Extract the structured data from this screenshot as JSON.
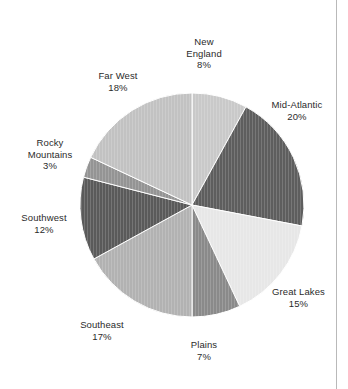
{
  "chart_data": {
    "type": "pie",
    "title": "",
    "subtitle": "",
    "xlabel": "",
    "ylabel": "",
    "legend_position": "none",
    "grid": false,
    "units": "percent",
    "start_angle_deg": 0,
    "direction": "clockwise",
    "categories": [
      "New England",
      "Mid-Atlantic",
      "Great Lakes",
      "Plains",
      "Southeast",
      "Southwest",
      "Rocky Mountains",
      "Far West"
    ],
    "values": [
      8,
      20,
      15,
      7,
      17,
      12,
      3,
      18
    ],
    "value_labels": [
      "8%",
      "20%",
      "15%",
      "7%",
      "17%",
      "12%",
      "3%",
      "18%"
    ],
    "colors": [
      "#c9c9c9",
      "#5e5e5e",
      "#e7e7e7",
      "#8a8a8a",
      "#b2b2b2",
      "#5a5a5a",
      "#949494",
      "#c2c2c2"
    ],
    "slices": [
      {
        "label": "New England",
        "label_line1": "New",
        "label_line2": "England",
        "percent_text": "8%",
        "value": 8,
        "color": "#c9c9c9"
      },
      {
        "label": "Mid-Atlantic",
        "label_line1": "Mid-Atlantic",
        "label_line2": "",
        "percent_text": "20%",
        "value": 20,
        "color": "#5e5e5e"
      },
      {
        "label": "Great Lakes",
        "label_line1": "Great Lakes",
        "label_line2": "",
        "percent_text": "15%",
        "value": 15,
        "color": "#e7e7e7"
      },
      {
        "label": "Plains",
        "label_line1": "Plains",
        "label_line2": "",
        "percent_text": "7%",
        "value": 7,
        "color": "#8a8a8a"
      },
      {
        "label": "Southeast",
        "label_line1": "Southeast",
        "label_line2": "",
        "percent_text": "17%",
        "value": 17,
        "color": "#b2b2b2"
      },
      {
        "label": "Southwest",
        "label_line1": "Southwest",
        "label_line2": "",
        "percent_text": "12%",
        "value": 12,
        "color": "#5a5a5a"
      },
      {
        "label": "Rocky Mountains",
        "label_line1": "Rocky",
        "label_line2": "Mountains",
        "percent_text": "3%",
        "value": 3,
        "color": "#949494"
      },
      {
        "label": "Far West",
        "label_line1": "Far West",
        "label_line2": "",
        "percent_text": "18%",
        "value": 18,
        "color": "#c2c2c2"
      }
    ]
  },
  "labels": {
    "new_england": {
      "line1": "New",
      "line2": "England",
      "pct": "8%"
    },
    "mid_atlantic": {
      "line1": "Mid-Atlantic",
      "line2": "",
      "pct": "20%"
    },
    "great_lakes": {
      "line1": "Great Lakes",
      "line2": "",
      "pct": "15%"
    },
    "plains": {
      "line1": "Plains",
      "line2": "",
      "pct": "7%"
    },
    "southeast": {
      "line1": "Southeast",
      "line2": "",
      "pct": "17%"
    },
    "southwest": {
      "line1": "Southwest",
      "line2": "",
      "pct": "12%"
    },
    "rocky_mountains": {
      "line1": "Rocky",
      "line2": "Mountains",
      "pct": "3%"
    },
    "far_west": {
      "line1": "Far West",
      "line2": "",
      "pct": "18%"
    }
  },
  "style": {
    "background": "#ffffff",
    "text_color": "#2b2b2b",
    "rule_color": "#b9b9b9",
    "slice_outline": "#ffffff"
  }
}
